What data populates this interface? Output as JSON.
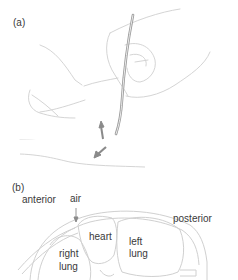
{
  "panels": [
    {
      "label": "(a)",
      "description": "hand holding needle/catheter inserted into chest, arrows indicating direction"
    },
    {
      "label": "(b)",
      "annotations": {
        "anterior": "anterior",
        "air": "air",
        "posterior": "posterior",
        "heart": "heart",
        "left_lung_1": "left",
        "left_lung_2": "lung",
        "right_lung_1": "right",
        "right_lung_2": "lung"
      }
    }
  ],
  "colors": {
    "line": "#c8c8c8",
    "needle": "#9a9a9a",
    "arrow": "#8a8a8a",
    "text": "#3a3a3a"
  }
}
